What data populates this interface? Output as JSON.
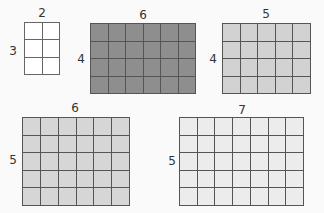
{
  "figures": [
    {
      "cols": 2,
      "rows": 3,
      "top_label": "2",
      "side_label": "3",
      "fill": "#ffffff",
      "border": "#666666",
      "x": 24,
      "y": 22,
      "w": 36,
      "h": 53,
      "top_lx": 42,
      "top_ly": 13,
      "side_lx": 13,
      "side_ly": 51
    },
    {
      "cols": 6,
      "rows": 4,
      "top_label": "6",
      "side_label": "4",
      "fill": "#8e8e8e",
      "border": "#555555",
      "x": 90,
      "y": 23,
      "w": 106,
      "h": 71,
      "top_lx": 143,
      "top_ly": 15,
      "side_lx": 81,
      "side_ly": 59
    },
    {
      "cols": 5,
      "rows": 4,
      "top_label": "5",
      "side_label": "4",
      "fill": "#d2d2d2",
      "border": "#555555",
      "x": 222,
      "y": 23,
      "w": 89,
      "h": 71,
      "top_lx": 266,
      "top_ly": 14,
      "side_lx": 213,
      "side_ly": 59
    },
    {
      "cols": 6,
      "rows": 5,
      "top_label": "6",
      "side_label": "5",
      "fill": "#d6d6d6",
      "border": "#555555",
      "x": 22,
      "y": 117,
      "w": 108,
      "h": 89,
      "top_lx": 75,
      "top_ly": 108,
      "side_lx": 13,
      "side_ly": 160
    },
    {
      "cols": 7,
      "rows": 5,
      "top_label": "7",
      "side_label": "5",
      "fill": "#ececec",
      "border": "#555555",
      "x": 179,
      "y": 117,
      "w": 125,
      "h": 89,
      "top_lx": 242,
      "top_ly": 110,
      "side_lx": 172,
      "side_ly": 161
    }
  ]
}
